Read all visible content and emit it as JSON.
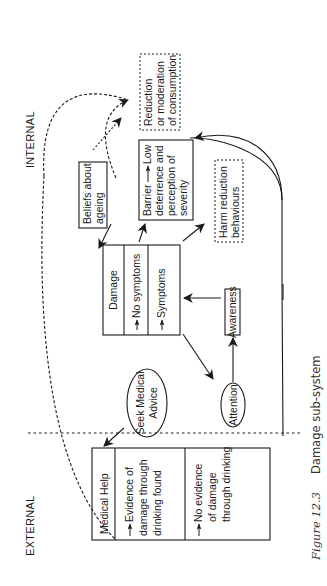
{
  "labels": {
    "external": "EXTERNAL",
    "internal": "INTERNAL"
  },
  "nodes": {
    "medical_help": {
      "title": "Medical Help",
      "rows": [
        [
          "Evidence of",
          "damage through",
          "drinking found"
        ],
        [
          "No evidence",
          "of damage",
          "through drinking"
        ]
      ]
    },
    "seek_medical_advice": [
      "Seek Medical",
      "Advice"
    ],
    "attention": "Attention",
    "awareness": "Awareness",
    "damage": {
      "title": "Damage",
      "rows": [
        "No symptoms",
        "Symptoms"
      ]
    },
    "beliefs_about_ageing": [
      "Beliefs about",
      "ageing"
    ],
    "barrier": [
      "Barrier",
      "Low",
      "deterrence and",
      "perception of",
      "severity"
    ],
    "harm_reduction": [
      "Harm reduction",
      "behaviours"
    ],
    "reduction": [
      "Reduction",
      "or moderation",
      "of consumption"
    ]
  },
  "caption": {
    "figure": "Figure 12.3",
    "title": "Damage sub-system"
  },
  "colors": {
    "ink": "#1a1a1a",
    "background": "#ffffff"
  }
}
